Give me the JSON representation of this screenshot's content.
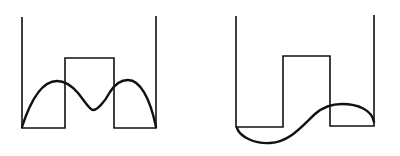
{
  "diagram": {
    "panels": [
      {
        "id": "symmetric",
        "label": "",
        "well_path": "M22,17 L22,128 L65,128 L65,58 L114,58 L114,128 L156,128 L156,16",
        "wave_path": "M22,127 C32,96 44,81 57,81 C66,81 72,86 78,93 C86,103 90,110 93,110 C97,110 104,103 110,92 C115,84 121,80 128,80 C140,80 150,98 156,127",
        "wave_shape": "symmetric two-hump state"
      },
      {
        "id": "antisymmetric",
        "label": "",
        "well_path": "M236,16 L236,127 L283,127 L283,56 L330,56 L330,126 L374,126 L374,15",
        "wave_path": "M237,128 C240,137 255,144 270,143 C290,142 303,125 315,114 C323,107 332,104 342,104 C358,104 372,110 374,122",
        "wave_shape": "antisymmetric state"
      }
    ],
    "stroke_color": "#111111",
    "background": "#ffffff"
  }
}
